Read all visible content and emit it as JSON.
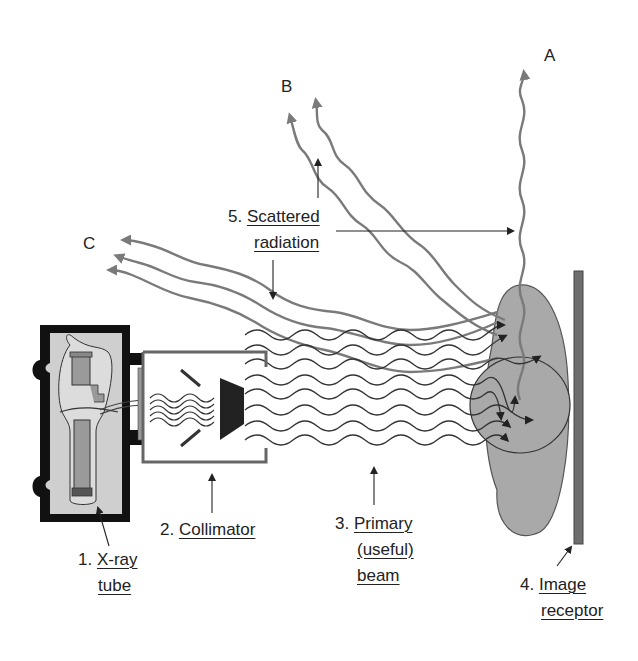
{
  "diagram": {
    "colors": {
      "primary_beam": "#333333",
      "scatter": "#7a7a7a",
      "patient": "#a9a9a9",
      "tube_housing": "#111111",
      "tube_fill": "#cfcfcf",
      "receptor": "#6e6e6e",
      "collimator": "#666666"
    },
    "letters": {
      "a": "A",
      "b": "B",
      "c": "C"
    },
    "labels": {
      "xray_tube": {
        "num": "1.",
        "line1": "X-ray",
        "line2": "tube"
      },
      "collimator": {
        "num": "2.",
        "line1": "Collimator"
      },
      "primary_beam": {
        "num": "3.",
        "line1": "Primary",
        "line2": "(useful)",
        "line3": "beam"
      },
      "image_receptor": {
        "num": "4.",
        "line1": "Image",
        "line2": "receptor"
      },
      "scattered_radiation": {
        "num": "5.",
        "line1": "Scattered",
        "line2": "radiation"
      }
    }
  }
}
